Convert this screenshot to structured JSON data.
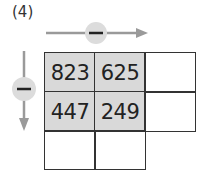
{
  "problem_label": "(4)",
  "operation": {
    "horizontal": {
      "symbol": "minus",
      "direction": "right"
    },
    "vertical": {
      "symbol": "minus",
      "direction": "down"
    }
  },
  "grid": {
    "rows": [
      [
        "823",
        "625",
        ""
      ],
      [
        "447",
        "249",
        ""
      ],
      [
        "",
        ""
      ]
    ]
  },
  "colors": {
    "shaded_cell": "#d9d9d9",
    "arrow": "#9a9a9a",
    "circle": "#dcdcdc"
  }
}
